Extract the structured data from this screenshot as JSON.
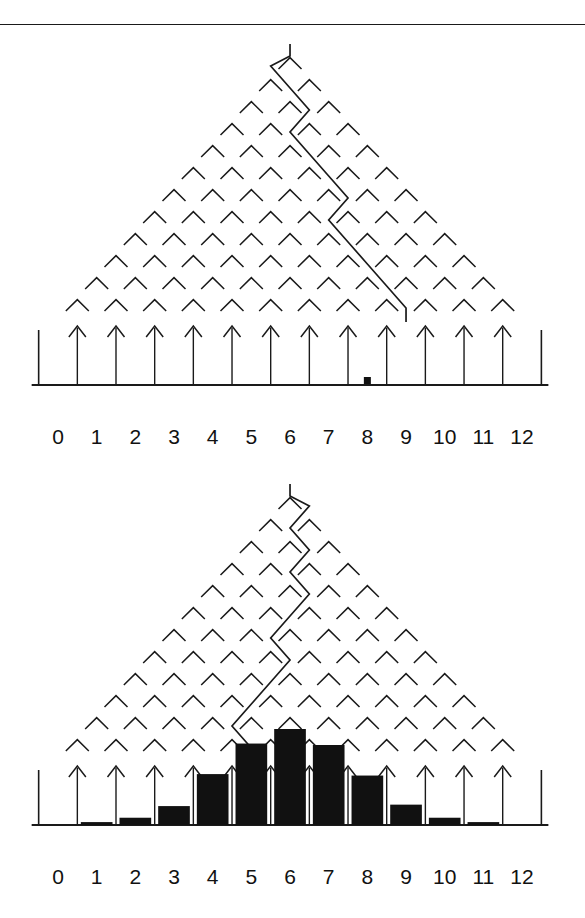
{
  "figure": {
    "kind": "galton-board",
    "title": "",
    "divider_rule": true,
    "panels": [
      {
        "name": "single-ball-trial",
        "rows": 12,
        "bins": 13,
        "ball_bin": 8,
        "ball_marker": "filled-square",
        "path_direction_sequence": [
          "L",
          "R",
          "R",
          "L",
          "R",
          "R",
          "R",
          "L",
          "R",
          "R",
          "R",
          "R"
        ],
        "bin_labels": [
          "0",
          "1",
          "2",
          "3",
          "4",
          "5",
          "6",
          "7",
          "8",
          "9",
          "10",
          "11",
          "12"
        ],
        "bar_values": [
          0,
          0,
          0,
          0,
          0,
          0,
          0,
          0,
          0,
          0,
          0,
          0,
          0
        ]
      },
      {
        "name": "accumulated-distribution",
        "rows": 12,
        "bins": 13,
        "path_direction_sequence": [
          "R",
          "L",
          "R",
          "L",
          "R",
          "L",
          "L",
          "R",
          "L",
          "L",
          "L",
          "R"
        ],
        "bin_labels": [
          "0",
          "1",
          "2",
          "3",
          "4",
          "5",
          "6",
          "7",
          "8",
          "9",
          "10",
          "11",
          "12"
        ],
        "bar_values": [
          0,
          2,
          5,
          13,
          35,
          56,
          66,
          55,
          34,
          14,
          5,
          2,
          0
        ]
      }
    ]
  },
  "chart_data": [
    {
      "type": "bar",
      "title": "Galton board — single ball trial",
      "categories": [
        "0",
        "1",
        "2",
        "3",
        "4",
        "5",
        "6",
        "7",
        "8",
        "9",
        "10",
        "11",
        "12"
      ],
      "values": [
        0,
        0,
        0,
        0,
        0,
        0,
        0,
        0,
        1,
        0,
        0,
        0,
        0
      ],
      "xlabel": "",
      "ylabel": "",
      "ylim": [
        0,
        70
      ],
      "grid": false,
      "legend": "none",
      "annotations": [
        "12 rows of pegs",
        "single ball marker in bin 8",
        "zigzag trajectory from apex to bin 8"
      ]
    },
    {
      "type": "bar",
      "title": "Galton board — accumulated counts",
      "categories": [
        "0",
        "1",
        "2",
        "3",
        "4",
        "5",
        "6",
        "7",
        "8",
        "9",
        "10",
        "11",
        "12"
      ],
      "values": [
        0,
        2,
        5,
        13,
        35,
        56,
        66,
        55,
        34,
        14,
        5,
        2,
        0
      ],
      "xlabel": "",
      "ylabel": "",
      "ylim": [
        0,
        70
      ],
      "grid": false,
      "legend": "none",
      "annotations": [
        "12 rows of pegs",
        "binomial-shaped histogram peaking at bin 6",
        "zigzag trajectory from apex to bin 6"
      ]
    }
  ],
  "geometry": {
    "bin_count": 13,
    "bin_spacing_px": 38.67,
    "left_bin_center_px": 58,
    "peg_rows": 12,
    "row_spacing_px": 22,
    "stroke_color": "#1a1a1a",
    "fill_color": "#111111",
    "background": "#ffffff"
  }
}
